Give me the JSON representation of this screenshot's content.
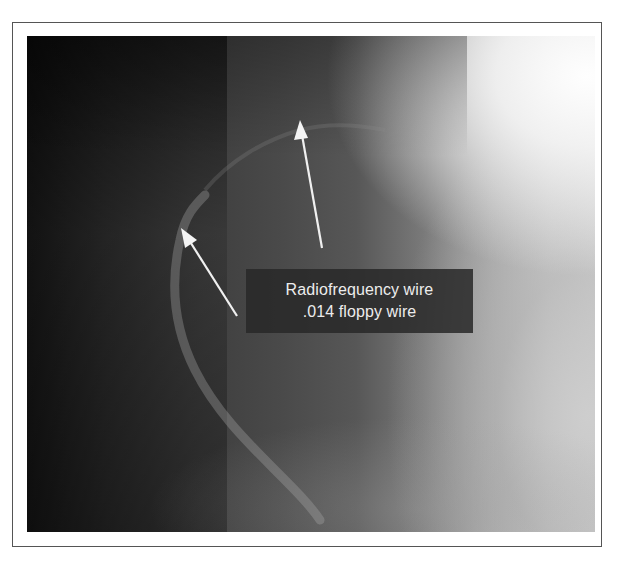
{
  "figure": {
    "type": "fluoroscopy image",
    "label": {
      "line1": "Radiofrequency wire",
      "line2": ".014 floppy wire"
    },
    "arrows": [
      {
        "name": "arrow-radiofrequency-wire",
        "tip": [
          300,
          122
        ],
        "tail": [
          322,
          248
        ]
      },
      {
        "name": "arrow-floppy-wire",
        "tip": [
          182,
          230
        ],
        "tail": [
          237,
          316
        ]
      }
    ],
    "colors": {
      "border": "#555555",
      "label_bg": "#282828",
      "label_text": "#ececec",
      "arrow": "#f0f0f0"
    }
  }
}
